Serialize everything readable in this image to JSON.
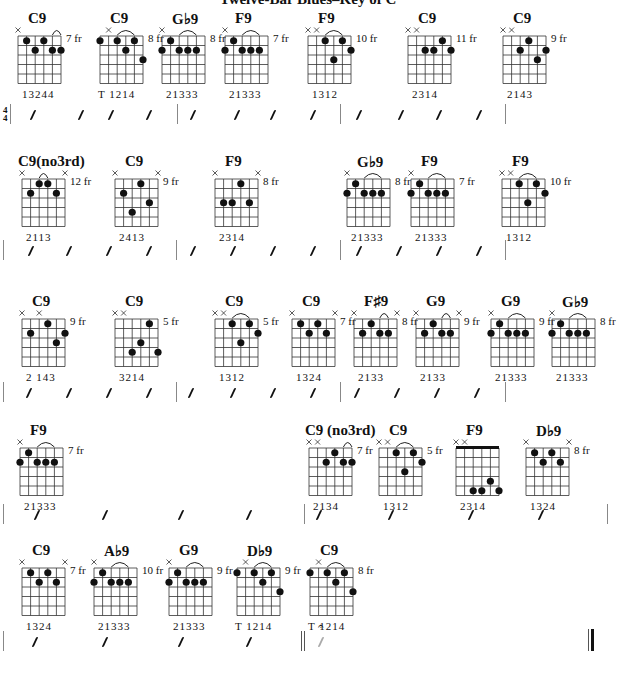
{
  "title": "Twelve-Bar Blues–Key of C",
  "time_signature": {
    "top": "4",
    "bottom": "4"
  },
  "rows": [
    {
      "chords": [
        {
          "name": "C9",
          "fret": "7 fr",
          "fingers": "13244",
          "x": 18,
          "mutes": [
            0
          ],
          "dots": [
            [
              1,
              0
            ],
            [
              2,
              1
            ],
            [
              3,
              0
            ],
            [
              4,
              1
            ],
            [
              5,
              1
            ]
          ],
          "arc": [
            4,
            5
          ],
          "extra_left": false
        },
        {
          "name": "C9",
          "fret": "8 fr",
          "fingers": "T  1214",
          "x": 100,
          "mutes": [
            1
          ],
          "dots": [
            [
              0,
              0
            ],
            [
              2,
              0
            ],
            [
              3,
              1
            ],
            [
              4,
              0
            ],
            [
              5,
              2
            ]
          ],
          "arc": [
            2,
            4
          ],
          "thumb": true
        },
        {
          "name": "G♭9",
          "fret": "8 fr",
          "fingers": "21333",
          "x": 162,
          "mutes": [
            0
          ],
          "dots": [
            [
              0,
              1
            ],
            [
              1,
              0
            ],
            [
              2,
              1
            ],
            [
              3,
              1
            ],
            [
              4,
              1
            ]
          ],
          "arc": [
            2,
            4
          ]
        },
        {
          "name": "F9",
          "fret": "7 fr",
          "fingers": "21333",
          "x": 225,
          "mutes": [
            0
          ],
          "dots": [
            [
              0,
              1
            ],
            [
              1,
              0
            ],
            [
              2,
              1
            ],
            [
              3,
              1
            ],
            [
              4,
              1
            ]
          ],
          "arc": [
            2,
            4
          ]
        },
        {
          "name": "F9",
          "fret": "10 fr",
          "fingers": "1312",
          "x": 308,
          "mutes": [
            0,
            1
          ],
          "dots": [
            [
              2,
              0
            ],
            [
              3,
              2
            ],
            [
              4,
              0
            ],
            [
              5,
              1
            ]
          ],
          "arc": [
            2,
            4
          ]
        },
        {
          "name": "C9",
          "fret": "11 fr",
          "fingers": "2314",
          "x": 408,
          "mutes": [
            0,
            1
          ],
          "dots": [
            [
              2,
              1
            ],
            [
              3,
              1
            ],
            [
              4,
              0
            ],
            [
              5,
              1
            ]
          ]
        },
        {
          "name": "C9",
          "fret": "9 fr",
          "fingers": "2143",
          "x": 503,
          "mutes": [
            0,
            1
          ],
          "dots": [
            [
              2,
              1
            ],
            [
              3,
              0
            ],
            [
              4,
              2
            ],
            [
              5,
              1
            ]
          ]
        }
      ]
    },
    {
      "chords": [
        {
          "name": "C9(no3rd)",
          "fret": "12 fr",
          "fingers": "2113",
          "x": 22,
          "mutes": [
            0,
            5
          ],
          "dots": [
            [
              1,
              1
            ],
            [
              2,
              0
            ],
            [
              3,
              0
            ],
            [
              4,
              1
            ]
          ],
          "arc": [
            2,
            3
          ]
        },
        {
          "name": "C9",
          "fret": "9 fr",
          "fingers": "2413",
          "x": 115,
          "mutes": [
            0,
            5
          ],
          "dots": [
            [
              1,
              1
            ],
            [
              2,
              3
            ],
            [
              3,
              0
            ],
            [
              4,
              2
            ]
          ]
        },
        {
          "name": "F9",
          "fret": "8 fr",
          "fingers": "2314",
          "x": 215,
          "mutes": [
            0,
            5
          ],
          "dots": [
            [
              1,
              2
            ],
            [
              2,
              2
            ],
            [
              3,
              0
            ],
            [
              4,
              2
            ]
          ]
        },
        {
          "name": "G♭9",
          "fret": "8 fr",
          "fingers": "21333",
          "x": 347,
          "mutes": [
            0
          ],
          "dots": [
            [
              0,
              1
            ],
            [
              1,
              0
            ],
            [
              2,
              1
            ],
            [
              3,
              1
            ],
            [
              4,
              1
            ]
          ],
          "arc": [
            2,
            4
          ]
        },
        {
          "name": "F9",
          "fret": "7 fr",
          "fingers": "21333",
          "x": 411,
          "mutes": [
            0
          ],
          "dots": [
            [
              0,
              1
            ],
            [
              1,
              0
            ],
            [
              2,
              1
            ],
            [
              3,
              1
            ],
            [
              4,
              1
            ]
          ],
          "arc": [
            2,
            4
          ]
        },
        {
          "name": "F9",
          "fret": "10 fr",
          "fingers": "1312",
          "x": 502,
          "mutes": [
            0,
            1
          ],
          "dots": [
            [
              2,
              0
            ],
            [
              3,
              2
            ],
            [
              4,
              0
            ],
            [
              5,
              1
            ]
          ],
          "arc": [
            2,
            4
          ]
        }
      ]
    },
    {
      "chords": [
        {
          "name": "C9",
          "fret": "9 fr",
          "fingers": "2  143",
          "x": 22,
          "mutes": [
            0,
            2
          ],
          "dots": [
            [
              1,
              1
            ],
            [
              3,
              0
            ],
            [
              4,
              2
            ],
            [
              5,
              1
            ]
          ]
        },
        {
          "name": "C9",
          "fret": "5 fr",
          "fingers": "3214",
          "x": 115,
          "mutes": [
            0,
            1
          ],
          "dots": [
            [
              2,
              3
            ],
            [
              3,
              2
            ],
            [
              4,
              0
            ],
            [
              5,
              3
            ]
          ]
        },
        {
          "name": "C9",
          "fret": "5 fr",
          "fingers": "1312",
          "x": 215,
          "mutes": [
            0,
            1
          ],
          "dots": [
            [
              2,
              0
            ],
            [
              3,
              2
            ],
            [
              4,
              0
            ],
            [
              5,
              1
            ]
          ],
          "arc": [
            2,
            4
          ]
        },
        {
          "name": "C9",
          "fret": "7 fr",
          "fingers": "1324",
          "x": 292,
          "mutes": [
            0,
            5
          ],
          "dots": [
            [
              1,
              0
            ],
            [
              2,
              1
            ],
            [
              3,
              0
            ],
            [
              4,
              1
            ]
          ]
        },
        {
          "name": "F♯9",
          "fret": "8 fr",
          "fingers": "2133",
          "x": 354,
          "mutes": [
            0,
            5
          ],
          "dots": [
            [
              1,
              1
            ],
            [
              2,
              0
            ],
            [
              3,
              1
            ],
            [
              4,
              1
            ]
          ],
          "arc": [
            3,
            4
          ]
        },
        {
          "name": "G9",
          "fret": "9 fr",
          "fingers": "2133",
          "x": 416,
          "mutes": [
            0,
            5
          ],
          "dots": [
            [
              1,
              1
            ],
            [
              2,
              0
            ],
            [
              3,
              1
            ],
            [
              4,
              1
            ]
          ],
          "arc": [
            3,
            4
          ]
        },
        {
          "name": "G9",
          "fret": "9 fr",
          "fingers": "21333",
          "x": 491,
          "mutes": [
            0
          ],
          "dots": [
            [
              0,
              1
            ],
            [
              1,
              0
            ],
            [
              2,
              1
            ],
            [
              3,
              1
            ],
            [
              4,
              1
            ]
          ],
          "arc": [
            2,
            4
          ]
        },
        {
          "name": "G♭9",
          "fret": "8 fr",
          "fingers": "21333",
          "x": 552,
          "mutes": [
            0
          ],
          "dots": [
            [
              0,
              1
            ],
            [
              1,
              0
            ],
            [
              2,
              1
            ],
            [
              3,
              1
            ],
            [
              4,
              1
            ]
          ],
          "arc": [
            2,
            4
          ]
        }
      ]
    },
    {
      "chords": [
        {
          "name": "F9",
          "fret": "7 fr",
          "fingers": "21333",
          "x": 20,
          "mutes": [
            0
          ],
          "dots": [
            [
              0,
              1
            ],
            [
              1,
              0
            ],
            [
              2,
              1
            ],
            [
              3,
              1
            ],
            [
              4,
              1
            ]
          ],
          "arc": [
            2,
            4
          ]
        },
        {
          "name": "C9 (no3rd)",
          "fret": "7 fr",
          "fingers": "2134",
          "x": 309,
          "mutes": [
            0,
            1
          ],
          "dots": [
            [
              2,
              1
            ],
            [
              3,
              0
            ],
            [
              4,
              1
            ],
            [
              5,
              1
            ]
          ],
          "arc": [
            4,
            5
          ]
        },
        {
          "name": "C9",
          "fret": "5 fr",
          "fingers": "1312",
          "x": 379,
          "mutes": [
            0,
            1
          ],
          "dots": [
            [
              2,
              0
            ],
            [
              3,
              2
            ],
            [
              4,
              0
            ],
            [
              5,
              1
            ]
          ],
          "arc": [
            2,
            4
          ]
        },
        {
          "name": "F9",
          "fret": "",
          "fingers": "2314",
          "x": 456,
          "mutes": [
            0,
            1
          ],
          "dots": [
            [
              2,
              4
            ],
            [
              3,
              4
            ],
            [
              4,
              3
            ],
            [
              5,
              4
            ]
          ],
          "nut": true
        },
        {
          "name": "D♭9",
          "fret": "8 fr",
          "fingers": "1324",
          "x": 526,
          "mutes": [
            0,
            5
          ],
          "dots": [
            [
              1,
              0
            ],
            [
              2,
              1
            ],
            [
              3,
              0
            ],
            [
              4,
              1
            ]
          ]
        }
      ]
    },
    {
      "chords": [
        {
          "name": "C9",
          "fret": "7 fr",
          "fingers": "1324",
          "x": 22,
          "mutes": [
            0,
            5
          ],
          "dots": [
            [
              1,
              0
            ],
            [
              2,
              1
            ],
            [
              3,
              0
            ],
            [
              4,
              1
            ]
          ]
        },
        {
          "name": "A♭9",
          "fret": "10 fr",
          "fingers": "21333",
          "x": 94,
          "mutes": [
            0
          ],
          "dots": [
            [
              0,
              1
            ],
            [
              1,
              0
            ],
            [
              2,
              1
            ],
            [
              3,
              1
            ],
            [
              4,
              1
            ]
          ],
          "arc": [
            2,
            4
          ]
        },
        {
          "name": "G9",
          "fret": "9 fr",
          "fingers": "21333",
          "x": 169,
          "mutes": [
            0
          ],
          "dots": [
            [
              0,
              1
            ],
            [
              1,
              0
            ],
            [
              2,
              1
            ],
            [
              3,
              1
            ],
            [
              4,
              1
            ]
          ],
          "arc": [
            2,
            4
          ]
        },
        {
          "name": "D♭9",
          "fret": "9 fr",
          "fingers": "T  1214",
          "x": 237,
          "mutes": [
            1
          ],
          "dots": [
            [
              0,
              0
            ],
            [
              2,
              0
            ],
            [
              3,
              1
            ],
            [
              4,
              0
            ],
            [
              5,
              2
            ]
          ],
          "arc": [
            2,
            4
          ],
          "thumb": true
        },
        {
          "name": "C9",
          "fret": "8 fr",
          "fingers": "T  1214",
          "x": 310,
          "mutes": [
            1
          ],
          "dots": [
            [
              0,
              0
            ],
            [
              2,
              0
            ],
            [
              3,
              1
            ],
            [
              4,
              0
            ],
            [
              5,
              2
            ]
          ],
          "arc": [
            2,
            4
          ],
          "thumb": true
        }
      ]
    }
  ],
  "fermata": "𝄐"
}
